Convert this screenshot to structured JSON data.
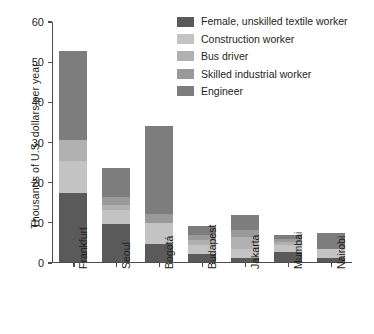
{
  "chart_data": {
    "type": "bar",
    "subtype": "stacked-bar",
    "title": "",
    "xlabel": "",
    "ylabel": "Thousands of U.S. dollars per year",
    "ylim": [
      0,
      60
    ],
    "yticks": [
      0,
      10,
      20,
      30,
      40,
      50,
      60
    ],
    "grid": false,
    "legend_position": "top-right",
    "categories": [
      "Frankfurt",
      "Seoul",
      "Bogotá",
      "Budapest",
      "Jakarta",
      "Mumbai",
      "Nairobi"
    ],
    "series": [
      {
        "name": "Female, unskilled textile worker",
        "color": "#5a5a5a",
        "values": [
          17.2,
          9.5,
          4.5,
          2.0,
          0.9,
          2.5,
          0.9
        ]
      },
      {
        "name": "Construction worker",
        "color": "#c3c3c3",
        "values": [
          8.0,
          3.4,
          5.1,
          2.2,
          2.2,
          1.6,
          2.3
        ]
      },
      {
        "name": "Bus driver",
        "color": "#b0b0b0",
        "values": [
          5.1,
          1.2,
          0.0,
          1.3,
          3.0,
          0.9,
          0.0
        ]
      },
      {
        "name": "Skilled industrial worker",
        "color": "#9a9a9a",
        "values": [
          0.0,
          2.0,
          2.4,
          1.2,
          1.9,
          0.8,
          0.0
        ]
      },
      {
        "name": "Engineer",
        "color": "#7d7d7d",
        "values": [
          22.2,
          7.2,
          21.8,
          2.2,
          3.6,
          1.0,
          4.1
        ]
      }
    ],
    "totals": [
      52.5,
      23.3,
      33.8,
      8.9,
      11.6,
      6.8,
      7.3
    ]
  },
  "legend": {
    "items": [
      {
        "label": "Female, unskilled textile worker",
        "color": "#5a5a5a"
      },
      {
        "label": "Construction worker",
        "color": "#c3c3c3"
      },
      {
        "label": "Bus driver",
        "color": "#b0b0b0"
      },
      {
        "label": "Skilled industrial worker",
        "color": "#9a9a9a"
      },
      {
        "label": "Engineer",
        "color": "#7d7d7d"
      }
    ]
  },
  "axes": {
    "y_title": "Thousands of U.S. dollars per year",
    "y_tick_labels": [
      "0",
      "10",
      "20",
      "30",
      "40",
      "50",
      "60"
    ],
    "x_tick_labels": [
      "Frankfurt",
      "Seoul",
      "Bogotá",
      "Budapest",
      "Jakarta",
      "Mumbai",
      "Nairobi"
    ]
  },
  "colors": {
    "axis": "#4d4d4d",
    "text": "#231f20",
    "background": "#ffffff"
  }
}
